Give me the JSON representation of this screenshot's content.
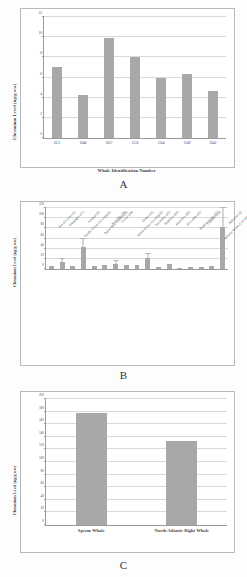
{
  "figure": {
    "panels": [
      {
        "letter": "A",
        "chart_data": {
          "type": "bar",
          "title": "",
          "xlabel": "Whale Identification Number",
          "ylabel": "Chromium Level (ng/g ww)",
          "ylim": [
            0,
            12
          ],
          "yticks": [
            0,
            2,
            4,
            6,
            8,
            10,
            12
          ],
          "grid": true,
          "categories": [
            "1611",
            "1646",
            "1657",
            "1516",
            "1564",
            "1249",
            "2642"
          ],
          "values": [
            7.0,
            4.3,
            9.9,
            8.0,
            6.0,
            6.3,
            4.7
          ]
        }
      },
      {
        "letter": "B",
        "chart_data": {
          "type": "bar",
          "title": "",
          "xlabel": "",
          "ylabel": "Chromium Level (ng/g ww)",
          "ylim": [
            0,
            120
          ],
          "yticks": [
            0,
            20,
            40,
            60,
            80,
            100,
            120
          ],
          "grid": true,
          "categories": [
            "Sea of Cortez (2)",
            "Galapagos (11)",
            "Pacific Ocean Crossing (2)",
            "Kiribati (6)",
            "Papua New Guinea (26)",
            "Australia (19)",
            "Crozet (18)",
            "Indian Ocean Crossing (6)",
            "Oman (12)",
            "Seychelles (25)",
            "Maldives (26)",
            "Mauritius (26)",
            "Sri Lanka (21)",
            "Mediterranean (27)",
            "Canaries (23)",
            "Atlantic Ocean Crossing (18)",
            "Bahamas (2)"
          ],
          "values": [
            6.0,
            13.0,
            5.0,
            44.0,
            5.0,
            8.0,
            10.0,
            7.0,
            8.0,
            21.0,
            4.0,
            9.0,
            2.0,
            4.0,
            3.0,
            6.0,
            82.0
          ],
          "errors": [
            0,
            6.0,
            0,
            15.0,
            0,
            0,
            5.0,
            0,
            0,
            8.0,
            0,
            0,
            0,
            0,
            0,
            0,
            38.0
          ]
        }
      },
      {
        "letter": "C",
        "chart_data": {
          "type": "bar",
          "title": "",
          "xlabel": "",
          "ylabel": "Chromium Level (ng/g ww)",
          "ylim": [
            0,
            200
          ],
          "yticks": [
            0,
            20,
            40,
            60,
            80,
            100,
            120,
            140,
            160,
            180,
            200
          ],
          "grid": true,
          "categories": [
            "Sperm Whale",
            "North Atlantic Right Whale"
          ],
          "values": [
            178.0,
            134.0
          ]
        }
      }
    ]
  },
  "style": {
    "bar_color": "#a8a8a8",
    "grid_color": "#d9d9d9",
    "axis_color": "#9a9a9a",
    "text_color": "#3f3f3f"
  }
}
